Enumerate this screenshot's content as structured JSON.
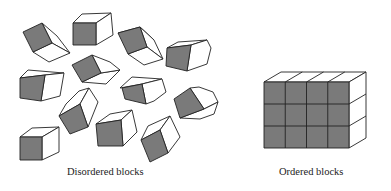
{
  "figure": {
    "left_panel": {
      "caption": "Disordered blocks",
      "block_count": 12,
      "description": "Cubes scattered at random orientations"
    },
    "right_panel": {
      "caption": "Ordered blocks",
      "grid": {
        "columns": 4,
        "rows": 3
      },
      "description": "Cubes stacked in a regular 4×3 front-facing arrangement"
    },
    "colors": {
      "shaded_face": "#7a7a7a",
      "light_face": "#ffffff",
      "outline": "#222222"
    }
  }
}
